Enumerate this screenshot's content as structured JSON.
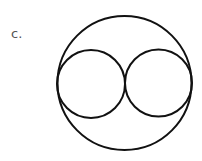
{
  "label": "c.",
  "diagram": {
    "stroke_color": "#111111",
    "outer_circle": {
      "cx": 124.5,
      "cy": 83,
      "r": 67
    },
    "inner_circles": [
      {
        "cx": 91,
        "cy": 84,
        "r": 34
      },
      {
        "cx": 158.5,
        "cy": 83,
        "r": 33.5
      }
    ]
  }
}
